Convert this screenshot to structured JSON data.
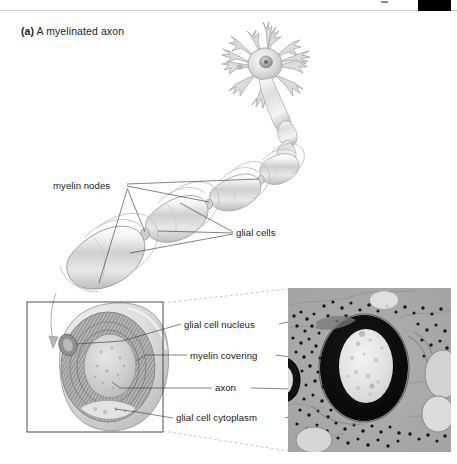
{
  "figure": {
    "caption_letter": "(a)",
    "caption_text": "A myelinated axon",
    "background_color": "#ffffff",
    "text_color": "#231f20"
  },
  "labels": {
    "myelin_nodes": "myelin nodes",
    "glial_cells": "glial cells",
    "glial_cell_nucleus": "glial cell nucleus",
    "myelin_covering": "myelin covering",
    "axon": "axon",
    "glial_cell_cytoplasm": "glial cell cytoplasm"
  },
  "diagram": {
    "neuron_soma": "neuron cell body with dendrites",
    "axon_segments": "chain of myelinated internodal segments",
    "cutaway": "cross-section cutaway of myelinated axon",
    "cutaway_frame": "rectangular callout frame",
    "connector_style": "dashed"
  },
  "micrograph": {
    "type": "electron micrograph",
    "subject": "myelinated axon cross-section",
    "tone": "grayscale"
  },
  "colors": {
    "line": "#4a4a4a",
    "frame": "#3a3a3a",
    "dash": "#b0b0b0",
    "myelin_dark": "#8f8f8f",
    "myelin_light": "#d8d8d8",
    "axoplasm": "#c9c9c9",
    "black_block": "#000000"
  }
}
